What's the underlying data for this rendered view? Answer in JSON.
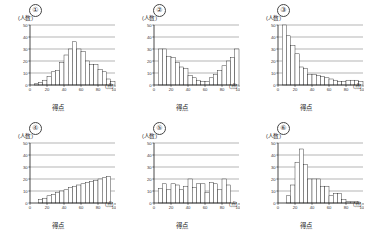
{
  "figure": {
    "panel_count": 6,
    "y_axis_unit_label": "(人数)",
    "x_axis_unit_label": "(点)",
    "x_axis_title": "得点",
    "y_ticks": [
      "0",
      "10",
      "20",
      "30",
      "40",
      "50"
    ],
    "x_ticks": [
      "0",
      "20",
      "40",
      "60",
      "80",
      "100"
    ]
  },
  "panels": [
    {
      "id": "panel-1",
      "number": "①",
      "ylabel": "(人数)",
      "xlabel": "得点",
      "xunit": "(点)",
      "chart_data": {
        "type": "bar",
        "title": "①",
        "xlabel": "得点",
        "ylabel": "(人数)",
        "xlim": [
          0,
          100
        ],
        "ylim": [
          0,
          50
        ],
        "grid": true,
        "bin_width": 5,
        "bin_starts": [
          0,
          5,
          10,
          15,
          20,
          25,
          30,
          35,
          40,
          45,
          50,
          55,
          60,
          65,
          70,
          75,
          80,
          85,
          90,
          95
        ],
        "values": [
          0,
          1,
          2,
          4,
          7,
          11,
          12,
          19,
          25,
          30,
          36,
          30,
          28,
          20,
          17,
          17,
          13,
          11,
          5,
          3
        ],
        "categories": [
          "0-5",
          "5-10",
          "10-15",
          "15-20",
          "20-25",
          "25-30",
          "30-35",
          "35-40",
          "40-45",
          "45-50",
          "50-55",
          "55-60",
          "60-65",
          "65-70",
          "70-75",
          "75-80",
          "80-85",
          "85-90",
          "90-95",
          "95-100"
        ]
      }
    },
    {
      "id": "panel-2",
      "number": "②",
      "ylabel": "(人数)",
      "xlabel": "得点",
      "xunit": "(点)",
      "chart_data": {
        "type": "bar",
        "title": "②",
        "xlabel": "得点",
        "ylabel": "(人数)",
        "xlim": [
          0,
          100
        ],
        "ylim": [
          0,
          50
        ],
        "grid": true,
        "bin_width": 5,
        "bin_starts": [
          0,
          5,
          10,
          15,
          20,
          25,
          30,
          35,
          40,
          45,
          50,
          55,
          60,
          65,
          70,
          75,
          80,
          85,
          90,
          95
        ],
        "values": [
          0,
          30,
          30,
          24,
          23,
          19,
          15,
          14,
          8,
          6,
          4,
          3,
          3,
          6,
          9,
          12,
          16,
          20,
          23,
          30
        ],
        "categories": [
          "0-5",
          "5-10",
          "10-15",
          "15-20",
          "20-25",
          "25-30",
          "30-35",
          "35-40",
          "40-45",
          "45-50",
          "50-55",
          "55-60",
          "60-65",
          "65-70",
          "70-75",
          "75-80",
          "80-85",
          "85-90",
          "90-95",
          "95-100"
        ]
      }
    },
    {
      "id": "panel-3",
      "number": "③",
      "ylabel": "(人数)",
      "xlabel": "得点",
      "xunit": "(点)",
      "chart_data": {
        "type": "bar",
        "title": "③",
        "xlabel": "得点",
        "ylabel": "(人数)",
        "xlim": [
          0,
          100
        ],
        "ylim": [
          0,
          50
        ],
        "grid": true,
        "bin_width": 5,
        "bin_starts": [
          0,
          5,
          10,
          15,
          20,
          25,
          30,
          35,
          40,
          45,
          50,
          55,
          60,
          65,
          70,
          75,
          80,
          85,
          90,
          95
        ],
        "values": [
          0,
          50,
          41,
          33,
          26,
          15,
          14,
          9,
          9,
          8,
          7,
          6,
          5,
          4,
          3,
          3,
          4,
          4,
          4,
          3
        ],
        "categories": [
          "0-5",
          "5-10",
          "10-15",
          "15-20",
          "20-25",
          "25-30",
          "30-35",
          "35-40",
          "40-45",
          "45-50",
          "50-55",
          "55-60",
          "60-65",
          "65-70",
          "70-75",
          "75-80",
          "80-85",
          "85-90",
          "90-95",
          "95-100"
        ]
      }
    },
    {
      "id": "panel-4",
      "number": "④",
      "ylabel": "(人数)",
      "xlabel": "得点",
      "xunit": "(点)",
      "chart_data": {
        "type": "bar",
        "title": "④",
        "xlabel": "得点",
        "ylabel": "(人数)",
        "xlim": [
          0,
          100
        ],
        "ylim": [
          0,
          50
        ],
        "grid": true,
        "bin_width": 5,
        "bin_starts": [
          0,
          5,
          10,
          15,
          20,
          25,
          30,
          35,
          40,
          45,
          50,
          55,
          60,
          65,
          70,
          75,
          80,
          85,
          90,
          95
        ],
        "values": [
          0,
          0,
          3,
          4,
          6,
          7,
          9,
          10,
          11,
          13,
          14,
          15,
          16,
          17,
          18,
          19,
          20,
          21,
          22,
          0
        ],
        "categories": [
          "0-5",
          "5-10",
          "10-15",
          "15-20",
          "20-25",
          "25-30",
          "30-35",
          "35-40",
          "40-45",
          "45-50",
          "50-55",
          "55-60",
          "60-65",
          "65-70",
          "70-75",
          "75-80",
          "80-85",
          "85-90",
          "90-95",
          "95-100"
        ]
      }
    },
    {
      "id": "panel-5",
      "number": "⑤",
      "ylabel": "(人数)",
      "xlabel": "得点",
      "xunit": "(点)",
      "chart_data": {
        "type": "bar",
        "title": "⑤",
        "xlabel": "得点",
        "ylabel": "(人数)",
        "xlim": [
          0,
          100
        ],
        "ylim": [
          0,
          50
        ],
        "grid": true,
        "bin_width": 5,
        "bin_starts": [
          0,
          5,
          10,
          15,
          20,
          25,
          30,
          35,
          40,
          45,
          50,
          55,
          60,
          65,
          70,
          75,
          80,
          85,
          90,
          95
        ],
        "values": [
          0,
          12,
          16,
          11,
          16,
          15,
          11,
          14,
          20,
          13,
          16,
          16,
          9,
          17,
          16,
          11,
          20,
          15,
          0,
          0
        ],
        "categories": [
          "0-5",
          "5-10",
          "10-15",
          "15-20",
          "20-25",
          "25-30",
          "30-35",
          "35-40",
          "40-45",
          "45-50",
          "50-55",
          "55-60",
          "60-65",
          "65-70",
          "70-75",
          "75-80",
          "80-85",
          "85-90",
          "90-95",
          "95-100"
        ]
      }
    },
    {
      "id": "panel-6",
      "number": "⑥",
      "ylabel": "(人数)",
      "xlabel": "得点",
      "xunit": "(点)",
      "chart_data": {
        "type": "bar",
        "title": "⑥",
        "xlabel": "得点",
        "ylabel": "(人数)",
        "xlim": [
          0,
          100
        ],
        "ylim": [
          0,
          50
        ],
        "grid": true,
        "bin_width": 5,
        "bin_starts": [
          0,
          5,
          10,
          15,
          20,
          25,
          30,
          35,
          40,
          45,
          50,
          55,
          60,
          65,
          70,
          75,
          80,
          85,
          90,
          95
        ],
        "values": [
          0,
          0,
          6,
          15,
          34,
          45,
          32,
          20,
          20,
          20,
          14,
          14,
          6,
          8,
          8,
          3,
          1,
          1,
          1,
          0
        ],
        "categories": [
          "0-5",
          "5-10",
          "10-15",
          "15-20",
          "20-25",
          "25-30",
          "30-35",
          "35-40",
          "40-45",
          "45-50",
          "50-55",
          "55-60",
          "60-65",
          "65-70",
          "70-75",
          "75-80",
          "80-85",
          "85-90",
          "90-95",
          "95-100"
        ]
      }
    }
  ]
}
